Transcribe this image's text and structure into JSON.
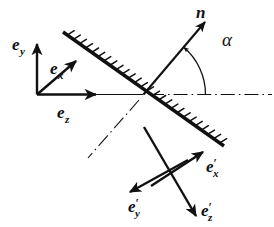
{
  "figure": {
    "background_color": "#ffffff",
    "ink_color": "#111111",
    "width": 274,
    "height": 227
  },
  "surface": {
    "name": "mirror-surface",
    "kind": "hatched-boundary-line",
    "hatch_side": "upper-right",
    "hatch_count": 26,
    "x1": 63,
    "y1": 32,
    "x2": 224,
    "y2": 146,
    "line_width": 3.4,
    "hatch_length": 7.5
  },
  "origin": {
    "name": "incidence-point",
    "x": 143.5,
    "y": 94.5
  },
  "optical_axis": {
    "name": "optical-axis-dashdot",
    "style": "dash-dot",
    "segments": [
      {
        "name": "axis-right",
        "x1": 150,
        "y1": 94.5,
        "x2": 272,
        "y2": 94.5
      },
      {
        "name": "axis-reflected-down-left",
        "x1": 139,
        "y1": 100,
        "x2": 88,
        "y2": 158
      }
    ]
  },
  "incident_ray": {
    "name": "incident-ray",
    "x1": 38,
    "y1": 94.5,
    "x2": 143.5,
    "y2": 94.5
  },
  "normal_vector": {
    "name": "normal-vector-n",
    "label": "n",
    "x1": 143.5,
    "y1": 94.5,
    "x2": 205,
    "y2": 22,
    "label_x": 196,
    "label_y": 18
  },
  "angle": {
    "name": "angle-alpha",
    "label": "α",
    "label_x": 222,
    "label_y": 46,
    "arc_radius": 62,
    "arc_start_deg": 0,
    "arc_end_deg": 49.5
  },
  "frames": [
    {
      "name": "unprimed-triad",
      "origin_x": 37,
      "origin_y": 94.5,
      "vectors": [
        {
          "name": "vector-e-y",
          "base": "e",
          "sub": "y",
          "prime": false,
          "x1": 37,
          "y1": 94.5,
          "x2": 37,
          "y2": 44,
          "label_x": 12,
          "label_y": 50,
          "sub_dx": 11,
          "sub_dy": 5
        },
        {
          "name": "vector-e-x",
          "base": "e",
          "sub": "x",
          "prime": false,
          "x1": 37,
          "y1": 94.5,
          "x2": 76,
          "y2": 61,
          "label_x": 50,
          "label_y": 74,
          "sub_dx": 11,
          "sub_dy": 5
        },
        {
          "name": "vector-e-z",
          "base": "e",
          "sub": "z",
          "prime": false,
          "x1": 37,
          "y1": 94.5,
          "x2": 96,
          "y2": 94.5,
          "label_x": 57,
          "label_y": 118,
          "sub_dx": 11,
          "sub_dy": 5
        }
      ]
    },
    {
      "name": "primed-triad",
      "origin_x": 170,
      "origin_y": 172,
      "vectors": [
        {
          "name": "vector-e-x-prime",
          "base": "e",
          "sub": "x",
          "prime": true,
          "x1": 151,
          "y1": 186,
          "x2": 203,
          "y2": 152,
          "label_x": 206,
          "label_y": 172,
          "sub_dx": 11,
          "sub_dy": 6
        },
        {
          "name": "vector-e-y-prime",
          "base": "e",
          "sub": "y",
          "prime": true,
          "x1": 188,
          "y1": 160,
          "x2": 130,
          "y2": 192,
          "label_x": 128,
          "label_y": 212,
          "sub_dx": 11,
          "sub_dy": 6
        },
        {
          "name": "vector-e-z-prime",
          "base": "e",
          "sub": "z",
          "prime": true,
          "x1": 144,
          "y1": 127,
          "x2": 196,
          "y2": 216,
          "label_x": 201,
          "label_y": 216,
          "sub_dx": 11,
          "sub_dy": 6
        }
      ]
    }
  ],
  "chart_data": {
    "type": "diagram",
    "labels": [
      "n",
      "α",
      "e_x",
      "e_y",
      "e_z",
      "e'_x",
      "e'_y",
      "e'_z"
    ],
    "annotations": [
      {
        "symbol": "n",
        "meaning": "surface normal unit vector"
      },
      {
        "symbol": "α",
        "meaning": "angle between normal and optical axis"
      },
      {
        "symbol": "e_x",
        "meaning": "incident frame x basis vector"
      },
      {
        "symbol": "e_y",
        "meaning": "incident frame y basis vector"
      },
      {
        "symbol": "e_z",
        "meaning": "incident frame z basis vector, along optical axis"
      },
      {
        "symbol": "e'_x",
        "meaning": "reflected frame x basis vector"
      },
      {
        "symbol": "e'_y",
        "meaning": "reflected frame y basis vector"
      },
      {
        "symbol": "e'_z",
        "meaning": "reflected frame z basis vector"
      }
    ]
  }
}
